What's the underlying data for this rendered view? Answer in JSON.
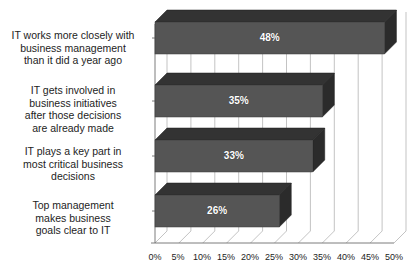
{
  "chart_data": {
    "type": "bar",
    "orientation": "horizontal",
    "title": "",
    "xlabel": "",
    "ylabel": "",
    "categories": [
      "IT works more closely with\nbusiness management\nthan it did a year ago",
      "IT gets involved in\nbusiness initiatives\nafter those decisions\nare already made",
      "IT plays a key part in\nmost critical business\ndecisions",
      "Top management\nmakes business\ngoals clear to IT"
    ],
    "values": [
      48,
      35,
      33,
      26
    ],
    "value_labels": [
      "48%",
      "35%",
      "33%",
      "26%"
    ],
    "xlim": [
      0,
      50
    ],
    "xticks": [
      0,
      5,
      10,
      15,
      20,
      25,
      30,
      35,
      40,
      45,
      50
    ],
    "xtick_labels": [
      "0%",
      "5%",
      "10%",
      "15%",
      "20%",
      "25%",
      "30%",
      "35%",
      "40%",
      "45%",
      "50%"
    ],
    "grid": true,
    "grid_axis": "x",
    "legend": "none",
    "three_d": true,
    "colors": {
      "bar_face": "#555555",
      "bar_top": "#333333",
      "bar_side": "#2b2b2b",
      "gridline": "#b4b4b4",
      "axis": "#6e6e6e",
      "value_label": "#ffffff",
      "text": "#1d1d1d",
      "background": "#ffffff"
    }
  }
}
